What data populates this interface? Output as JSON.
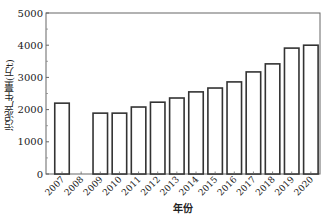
{
  "chart_data": {
    "type": "bar",
    "title": "",
    "xlabel": "年份",
    "ylabel": "污泥产生量(万t)",
    "ylim": [
      0,
      5000
    ],
    "yticks": [
      0,
      1000,
      2000,
      3000,
      4000,
      5000
    ],
    "categories": [
      "2007",
      "2008",
      "2009",
      "2010",
      "2011",
      "2012",
      "2013",
      "2014",
      "2015",
      "2016",
      "2017",
      "2018",
      "2019",
      "2020"
    ],
    "values": [
      2200,
      0,
      1890,
      1890,
      2080,
      2230,
      2360,
      2550,
      2670,
      2860,
      3170,
      3420,
      3910,
      4000
    ],
    "grid": false,
    "legend": null,
    "bar_style": {
      "fill": "#ffffff",
      "stroke": "#333333"
    }
  },
  "labels": {
    "xlabel": "年份",
    "ylabel": "污泥产生量(万t)"
  }
}
